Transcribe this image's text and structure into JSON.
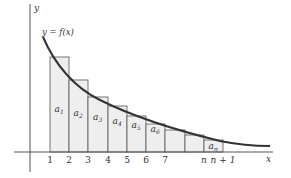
{
  "axes": {
    "x_label": "x",
    "y_label": "y"
  },
  "curve": {
    "label": "y = f(x)",
    "color": "#333333"
  },
  "rect_fill": "#eeeeee",
  "rect_stroke": "#555555",
  "ticks": [
    "1",
    "2",
    "3",
    "4",
    "5",
    "6",
    "7",
    "n",
    "n + 1"
  ],
  "rectangles": [
    {
      "label": "a",
      "sub": "1",
      "x": 50,
      "w": 19,
      "top": 57
    },
    {
      "label": "a",
      "sub": "2",
      "x": 69,
      "w": 19,
      "top": 80
    },
    {
      "label": "a",
      "sub": "3",
      "x": 88,
      "w": 20,
      "top": 97
    },
    {
      "label": "a",
      "sub": "4",
      "x": 108,
      "w": 19,
      "top": 106
    },
    {
      "label": "a",
      "sub": "5",
      "x": 127,
      "w": 19,
      "top": 116
    },
    {
      "label": "a",
      "sub": "6",
      "x": 146,
      "w": 19,
      "top": 124
    },
    {
      "label": "",
      "sub": "",
      "x": 165,
      "w": 20,
      "top": 130
    },
    {
      "label": "",
      "sub": "",
      "x": 185,
      "w": 19,
      "top": 135
    },
    {
      "label": "a",
      "sub": "n",
      "x": 204,
      "w": 19,
      "top": 140
    }
  ]
}
